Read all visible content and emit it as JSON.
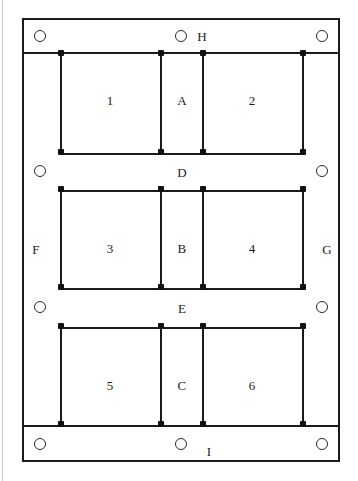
{
  "diagram": {
    "type": "structural-frame-elevation",
    "canvas": {
      "width": 358,
      "height": 481
    },
    "colors": {
      "line": "#1a1a1a",
      "joint": "#111111",
      "support": "#2b2b2b",
      "background": "#ffffff",
      "page_edge": "#c9c9c9"
    },
    "panels": [
      {
        "id": "p1",
        "label": "1",
        "x": 110,
        "y": 100
      },
      {
        "id": "pA",
        "label": "A",
        "x": 182,
        "y": 100
      },
      {
        "id": "p2",
        "label": "2",
        "x": 252,
        "y": 100
      },
      {
        "id": "p3",
        "label": "3",
        "x": 110,
        "y": 248
      },
      {
        "id": "pB",
        "label": "B",
        "x": 182,
        "y": 248
      },
      {
        "id": "p4",
        "label": "4",
        "x": 252,
        "y": 248
      },
      {
        "id": "p5",
        "label": "5",
        "x": 110,
        "y": 385
      },
      {
        "id": "pC",
        "label": "C",
        "x": 182,
        "y": 385
      },
      {
        "id": "p6",
        "label": "6",
        "x": 252,
        "y": 385
      }
    ],
    "bands": [
      {
        "id": "bandD",
        "label": "D",
        "x": 182,
        "y": 172
      },
      {
        "id": "bandE",
        "label": "E",
        "x": 182,
        "y": 308
      }
    ],
    "edge_labels": [
      {
        "id": "labelH",
        "label": "H",
        "x": 202,
        "y": 36
      },
      {
        "id": "labelF",
        "label": "F",
        "x": 36,
        "y": 249
      },
      {
        "id": "labelG",
        "label": "G",
        "x": 327,
        "y": 249
      },
      {
        "id": "labelI",
        "label": "I",
        "x": 209,
        "y": 451
      }
    ],
    "supports": [
      {
        "id": "support-top-left",
        "cx": 40,
        "cy": 36
      },
      {
        "id": "support-top-center",
        "cx": 181,
        "cy": 36
      },
      {
        "id": "support-top-right",
        "cx": 322,
        "cy": 36
      },
      {
        "id": "support-left-upper",
        "cx": 40,
        "cy": 171
      },
      {
        "id": "support-right-upper",
        "cx": 322,
        "cy": 171
      },
      {
        "id": "support-left-lower",
        "cx": 40,
        "cy": 307
      },
      {
        "id": "support-right-lower",
        "cx": 322,
        "cy": 307
      },
      {
        "id": "support-bottom-left",
        "cx": 40,
        "cy": 444
      },
      {
        "id": "support-bottom-center",
        "cx": 181,
        "cy": 444
      },
      {
        "id": "support-bottom-right",
        "cx": 322,
        "cy": 444
      }
    ],
    "columns": [
      {
        "id": "col-1",
        "x": 60,
        "y1": 52,
        "y2": 153
      },
      {
        "id": "col-2",
        "x": 160,
        "y1": 52,
        "y2": 153
      },
      {
        "id": "col-3",
        "x": 202,
        "y1": 52,
        "y2": 153
      },
      {
        "id": "col-4",
        "x": 302,
        "y1": 52,
        "y2": 153
      },
      {
        "id": "col-5",
        "x": 60,
        "y1": 190,
        "y2": 288
      },
      {
        "id": "col-6",
        "x": 160,
        "y1": 190,
        "y2": 288
      },
      {
        "id": "col-7",
        "x": 202,
        "y1": 190,
        "y2": 288
      },
      {
        "id": "col-8",
        "x": 302,
        "y1": 190,
        "y2": 288
      },
      {
        "id": "col-9",
        "x": 60,
        "y1": 327,
        "y2": 425
      },
      {
        "id": "col-10",
        "x": 160,
        "y1": 327,
        "y2": 425
      },
      {
        "id": "col-11",
        "x": 202,
        "y1": 327,
        "y2": 425
      },
      {
        "id": "col-12",
        "x": 302,
        "y1": 327,
        "y2": 425
      }
    ],
    "beams": [
      {
        "id": "beam-D-top",
        "x1": 60,
        "x2": 304,
        "y": 153
      },
      {
        "id": "beam-D-bottom",
        "x1": 60,
        "x2": 304,
        "y": 190
      },
      {
        "id": "beam-E-top",
        "x1": 60,
        "x2": 304,
        "y": 288
      },
      {
        "id": "beam-E-bottom",
        "x1": 60,
        "x2": 304,
        "y": 327
      }
    ],
    "hrules": [
      {
        "id": "rule-top-bar",
        "x1": 22,
        "x2": 340,
        "y": 52
      },
      {
        "id": "rule-bottom-bar",
        "x1": 22,
        "x2": 340,
        "y": 425
      }
    ],
    "joints": [
      {
        "id": "j-1",
        "x": 60,
        "y": 53
      },
      {
        "id": "j-2",
        "x": 160,
        "y": 53
      },
      {
        "id": "j-3",
        "x": 202,
        "y": 53
      },
      {
        "id": "j-4",
        "x": 302,
        "y": 53
      },
      {
        "id": "j-5",
        "x": 60,
        "y": 152
      },
      {
        "id": "j-6",
        "x": 160,
        "y": 152
      },
      {
        "id": "j-7",
        "x": 202,
        "y": 152
      },
      {
        "id": "j-8",
        "x": 302,
        "y": 152
      },
      {
        "id": "j-9",
        "x": 60,
        "y": 189
      },
      {
        "id": "j-10",
        "x": 160,
        "y": 189
      },
      {
        "id": "j-11",
        "x": 202,
        "y": 189
      },
      {
        "id": "j-12",
        "x": 302,
        "y": 189
      },
      {
        "id": "j-13",
        "x": 60,
        "y": 287
      },
      {
        "id": "j-14",
        "x": 160,
        "y": 287
      },
      {
        "id": "j-15",
        "x": 202,
        "y": 287
      },
      {
        "id": "j-16",
        "x": 302,
        "y": 287
      },
      {
        "id": "j-17",
        "x": 60,
        "y": 326
      },
      {
        "id": "j-18",
        "x": 160,
        "y": 326
      },
      {
        "id": "j-19",
        "x": 202,
        "y": 326
      },
      {
        "id": "j-20",
        "x": 302,
        "y": 326
      },
      {
        "id": "j-21",
        "x": 60,
        "y": 424
      },
      {
        "id": "j-22",
        "x": 160,
        "y": 424
      },
      {
        "id": "j-23",
        "x": 202,
        "y": 424
      },
      {
        "id": "j-24",
        "x": 302,
        "y": 424
      }
    ]
  }
}
